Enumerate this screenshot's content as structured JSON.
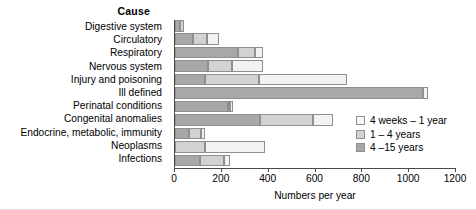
{
  "chart_data": {
    "type": "bar",
    "orientation": "horizontal",
    "stacked": true,
    "title": "Cause",
    "xlabel": "Numbers per year",
    "ylabel": "",
    "xlim": [
      0,
      1200
    ],
    "xticks": [
      0,
      200,
      400,
      600,
      800,
      1000,
      1200
    ],
    "grid": false,
    "legend_position": "right",
    "categories": [
      "Digestive system",
      "Circulatory",
      "Respiratory",
      "Nervous system",
      "Injury and poisoning",
      "Ill defined",
      "Perinatal conditions",
      "Congenital anomalies",
      "Endocrine, metabolic, immunity",
      "Neoplasms",
      "Infections"
    ],
    "series": [
      {
        "name": "4 -15 years",
        "color": "#a8a8a8",
        "values": [
          22,
          75,
          270,
          140,
          130,
          1060,
          225,
          365,
          60,
          0,
          105
        ]
      },
      {
        "name": "1 - 4 years",
        "color": "#d2d2d2",
        "values": [
          18,
          60,
          72,
          105,
          230,
          0,
          10,
          225,
          50,
          130,
          105
        ]
      },
      {
        "name": "4 weeks - 1 year",
        "color": "#f2f2f2",
        "values": [
          0,
          55,
          35,
          130,
          375,
          20,
          12,
          85,
          18,
          255,
          25
        ]
      }
    ],
    "totals": [
      40,
      190,
      377,
      375,
      735,
      1080,
      247,
      675,
      128,
      385,
      235
    ]
  },
  "legend": {
    "items": [
      {
        "label": "4 weeks – 1 year",
        "swatch": "light"
      },
      {
        "label": "1 – 4 years",
        "swatch": "mid"
      },
      {
        "label": "4 –15 years",
        "swatch": "dark"
      }
    ]
  },
  "axis": {
    "tick_labels": [
      "0",
      "200",
      "400",
      "600",
      "800",
      "1000",
      "1200"
    ]
  }
}
